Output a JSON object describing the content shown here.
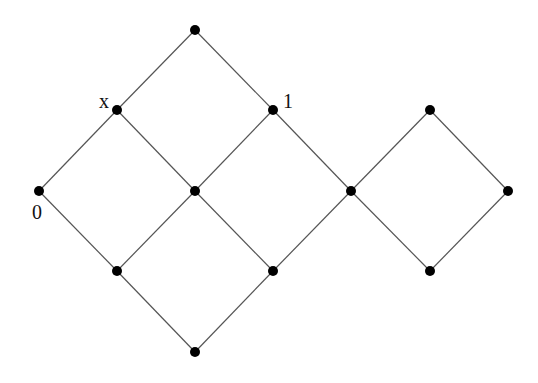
{
  "diagram": {
    "type": "lattice-hasse-diagram",
    "colors": {
      "edge": "#555555",
      "node": "#000000",
      "label": "#111111",
      "background": "#ffffff"
    },
    "node_radius": 5,
    "nodes": [
      {
        "id": "top",
        "x": 195,
        "y": 30,
        "label": ""
      },
      {
        "id": "x",
        "x": 117,
        "y": 110,
        "label": "x",
        "label_dx": -18,
        "label_dy": -2
      },
      {
        "id": "one",
        "x": 273,
        "y": 110,
        "label": "1",
        "label_dx": 10,
        "label_dy": -2
      },
      {
        "id": "zero",
        "x": 39,
        "y": 191,
        "label": "0",
        "label_dx": -7,
        "label_dy": 28
      },
      {
        "id": "center",
        "x": 195,
        "y": 191,
        "label": ""
      },
      {
        "id": "join",
        "x": 351,
        "y": 191,
        "label": ""
      },
      {
        "id": "right-top",
        "x": 430,
        "y": 110,
        "label": ""
      },
      {
        "id": "right-right",
        "x": 508,
        "y": 191,
        "label": ""
      },
      {
        "id": "right-bottom",
        "x": 430,
        "y": 271,
        "label": ""
      },
      {
        "id": "bottom-left",
        "x": 117,
        "y": 271,
        "label": ""
      },
      {
        "id": "bottom-right",
        "x": 273,
        "y": 271,
        "label": ""
      },
      {
        "id": "bottom",
        "x": 195,
        "y": 352,
        "label": ""
      }
    ],
    "edges": [
      [
        "top",
        "x"
      ],
      [
        "top",
        "one"
      ],
      [
        "x",
        "zero"
      ],
      [
        "x",
        "center"
      ],
      [
        "one",
        "center"
      ],
      [
        "one",
        "join"
      ],
      [
        "zero",
        "bottom-left"
      ],
      [
        "center",
        "bottom-left"
      ],
      [
        "center",
        "bottom-right"
      ],
      [
        "join",
        "bottom-right"
      ],
      [
        "bottom-left",
        "bottom"
      ],
      [
        "bottom-right",
        "bottom"
      ],
      [
        "join",
        "right-top"
      ],
      [
        "join",
        "right-bottom"
      ],
      [
        "right-top",
        "right-right"
      ],
      [
        "right-bottom",
        "right-right"
      ]
    ]
  }
}
